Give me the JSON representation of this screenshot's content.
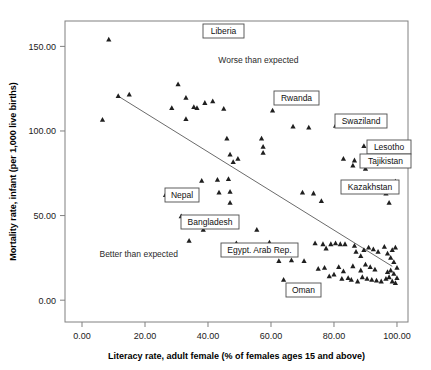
{
  "chart_data": {
    "type": "scatter",
    "title": "",
    "xlabel": "Literacy rate, adult female (% of females ages 15 and above)",
    "ylabel": "Mortality rate, infant (per 1,000 live births)",
    "xlim": [
      -5.4,
      103.5
    ],
    "ylim": [
      -12.9,
      165.0
    ],
    "xticks": [
      "0.00",
      "20.00",
      "40.00",
      "60.00",
      "80.00",
      "100.00"
    ],
    "xtick_values": [
      0,
      20,
      40,
      60,
      80,
      100
    ],
    "yticks": [
      "0.00",
      "50.00",
      "100.00",
      "150.00"
    ],
    "ytick_values": [
      0,
      50,
      100,
      150
    ],
    "grid": false,
    "legend": "none",
    "marker": "triangle",
    "marker_color": "#1f1f1f",
    "fit_line": {
      "type": "linear",
      "color": "#6b6b6b",
      "x_start": 12.0,
      "y_start": 120.0,
      "x_end": 98.5,
      "y_end": 20.0
    },
    "annotations": [
      {
        "text": "Worse than expected",
        "x": 56.0,
        "y": 140.0
      },
      {
        "text": "Better than expected",
        "x": 18.0,
        "y": 25.5
      }
    ],
    "point_labels": [
      {
        "text": "Liberia",
        "px": 40.0,
        "py": 157.0,
        "box_x": 203,
        "box_y": 24,
        "box_w": 41,
        "box_h": 14
      },
      {
        "text": "Rwanda",
        "px": 60.5,
        "py": 112.0,
        "box_x": 274,
        "box_y": 91,
        "box_w": 45,
        "box_h": 14
      },
      {
        "text": "Swaziland",
        "px": 80.5,
        "py": 103.0,
        "box_x": 335,
        "box_y": 114,
        "box_w": 52,
        "box_h": 14
      },
      {
        "text": "Lesotho",
        "px": 89.5,
        "py": 91.0,
        "box_x": 367,
        "box_y": 140,
        "box_w": 44,
        "box_h": 14
      },
      {
        "text": "Tajikistan",
        "px": 99.5,
        "py": 86.0,
        "box_x": 360,
        "box_y": 154,
        "box_w": 51,
        "box_h": 14
      },
      {
        "text": "Kazakhstan",
        "px": 99.5,
        "py": 70.0,
        "box_x": 341,
        "box_y": 180,
        "box_w": 58,
        "box_h": 14
      },
      {
        "text": "Nepal",
        "px": 26.5,
        "py": 62.0,
        "box_x": 165,
        "box_y": 188,
        "box_w": 34,
        "box_h": 14
      },
      {
        "text": "Bangladesh",
        "px": 31.5,
        "py": 49.5,
        "box_x": 181,
        "box_y": 215,
        "box_w": 58,
        "box_h": 14
      },
      {
        "text": "Egypt. Arab Rep.",
        "px": 49.0,
        "py": 33.5,
        "box_x": 221,
        "box_y": 243,
        "box_w": 77,
        "box_h": 14
      },
      {
        "text": "Oman",
        "px": 64.0,
        "py": 12.0,
        "box_x": 286,
        "box_y": 283,
        "box_w": 35,
        "box_h": 14
      }
    ],
    "points": [
      {
        "x": 8.5,
        "y": 154.0
      },
      {
        "x": 40.0,
        "y": 157.0
      },
      {
        "x": 6.5,
        "y": 106.5
      },
      {
        "x": 11.5,
        "y": 120.5
      },
      {
        "x": 15.0,
        "y": 121.5
      },
      {
        "x": 28.5,
        "y": 113.5
      },
      {
        "x": 30.5,
        "y": 127.5
      },
      {
        "x": 33.0,
        "y": 119.5
      },
      {
        "x": 35.5,
        "y": 114.0
      },
      {
        "x": 36.5,
        "y": 113.5
      },
      {
        "x": 39.0,
        "y": 116.5
      },
      {
        "x": 41.5,
        "y": 117.5
      },
      {
        "x": 33.0,
        "y": 107.0
      },
      {
        "x": 45.0,
        "y": 113.0
      },
      {
        "x": 60.5,
        "y": 112.0
      },
      {
        "x": 80.5,
        "y": 103.0
      },
      {
        "x": 67.0,
        "y": 102.5
      },
      {
        "x": 72.0,
        "y": 102.0
      },
      {
        "x": 46.0,
        "y": 95.5
      },
      {
        "x": 47.0,
        "y": 86.0
      },
      {
        "x": 48.0,
        "y": 81.5
      },
      {
        "x": 49.5,
        "y": 83.5
      },
      {
        "x": 57.0,
        "y": 95.5
      },
      {
        "x": 57.5,
        "y": 90.5
      },
      {
        "x": 57.5,
        "y": 87.0
      },
      {
        "x": 89.5,
        "y": 91.0
      },
      {
        "x": 99.5,
        "y": 86.0
      },
      {
        "x": 83.0,
        "y": 83.5
      },
      {
        "x": 86.5,
        "y": 82.5
      },
      {
        "x": 86.0,
        "y": 79.5
      },
      {
        "x": 90.0,
        "y": 77.5
      },
      {
        "x": 99.5,
        "y": 70.0
      },
      {
        "x": 26.5,
        "y": 62.0
      },
      {
        "x": 38.0,
        "y": 70.5
      },
      {
        "x": 43.0,
        "y": 71.0
      },
      {
        "x": 43.5,
        "y": 63.5
      },
      {
        "x": 46.5,
        "y": 71.5
      },
      {
        "x": 47.0,
        "y": 64.0
      },
      {
        "x": 47.0,
        "y": 57.5
      },
      {
        "x": 70.0,
        "y": 63.5
      },
      {
        "x": 73.5,
        "y": 63.0
      },
      {
        "x": 76.0,
        "y": 58.5
      },
      {
        "x": 96.5,
        "y": 63.0
      },
      {
        "x": 97.5,
        "y": 57.5
      },
      {
        "x": 31.5,
        "y": 49.5
      },
      {
        "x": 38.5,
        "y": 41.5
      },
      {
        "x": 34.0,
        "y": 35.0
      },
      {
        "x": 49.0,
        "y": 33.5
      },
      {
        "x": 55.5,
        "y": 41.5
      },
      {
        "x": 59.5,
        "y": 34.0
      },
      {
        "x": 56.5,
        "y": 28.5
      },
      {
        "x": 62.5,
        "y": 23.0
      },
      {
        "x": 66.5,
        "y": 23.5
      },
      {
        "x": 70.5,
        "y": 23.0
      },
      {
        "x": 64.0,
        "y": 12.0
      },
      {
        "x": 74.0,
        "y": 33.5
      },
      {
        "x": 76.5,
        "y": 33.0
      },
      {
        "x": 77.5,
        "y": 30.5
      },
      {
        "x": 79.0,
        "y": 33.0
      },
      {
        "x": 80.5,
        "y": 33.5
      },
      {
        "x": 82.0,
        "y": 33.0
      },
      {
        "x": 83.5,
        "y": 33.0
      },
      {
        "x": 86.5,
        "y": 32.0
      },
      {
        "x": 87.0,
        "y": 28.5
      },
      {
        "x": 88.5,
        "y": 26.0
      },
      {
        "x": 89.5,
        "y": 29.5
      },
      {
        "x": 91.0,
        "y": 31.0
      },
      {
        "x": 92.5,
        "y": 30.0
      },
      {
        "x": 94.0,
        "y": 28.5
      },
      {
        "x": 96.0,
        "y": 31.5
      },
      {
        "x": 97.0,
        "y": 27.5
      },
      {
        "x": 98.0,
        "y": 25.0
      },
      {
        "x": 98.5,
        "y": 29.5
      },
      {
        "x": 99.0,
        "y": 22.5
      },
      {
        "x": 99.5,
        "y": 31.0
      },
      {
        "x": 100.0,
        "y": 19.0
      },
      {
        "x": 90.0,
        "y": 21.0
      },
      {
        "x": 91.5,
        "y": 19.5
      },
      {
        "x": 93.0,
        "y": 18.0
      },
      {
        "x": 88.5,
        "y": 17.5
      },
      {
        "x": 86.0,
        "y": 20.0
      },
      {
        "x": 89.0,
        "y": 13.5
      },
      {
        "x": 90.5,
        "y": 12.5
      },
      {
        "x": 92.0,
        "y": 12.0
      },
      {
        "x": 93.5,
        "y": 11.5
      },
      {
        "x": 95.0,
        "y": 11.0
      },
      {
        "x": 96.5,
        "y": 12.5
      },
      {
        "x": 97.5,
        "y": 13.5
      },
      {
        "x": 98.5,
        "y": 11.0
      },
      {
        "x": 99.5,
        "y": 10.0
      },
      {
        "x": 100.0,
        "y": 13.0
      },
      {
        "x": 97.0,
        "y": 16.5
      },
      {
        "x": 98.0,
        "y": 17.5
      },
      {
        "x": 99.0,
        "y": 15.5
      },
      {
        "x": 81.5,
        "y": 19.5
      },
      {
        "x": 83.0,
        "y": 17.0
      },
      {
        "x": 84.5,
        "y": 13.0
      },
      {
        "x": 82.5,
        "y": 12.5
      },
      {
        "x": 80.0,
        "y": 15.0
      },
      {
        "x": 78.5,
        "y": 14.0
      },
      {
        "x": 85.5,
        "y": 12.0
      },
      {
        "x": 87.5,
        "y": 11.0
      },
      {
        "x": 77.0,
        "y": 19.0
      },
      {
        "x": 75.0,
        "y": 18.5
      }
    ]
  }
}
